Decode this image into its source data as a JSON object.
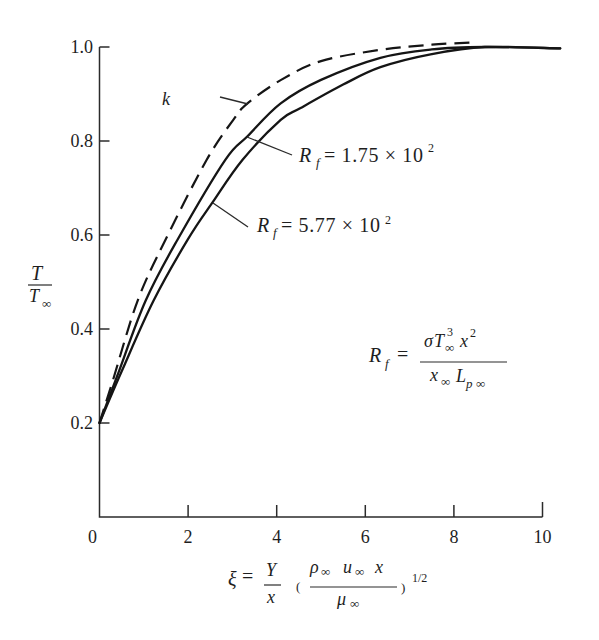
{
  "figure": {
    "y_axis_label": {
      "numerator": "T",
      "denominator": "T",
      "denominator_sub": "∞"
    },
    "x_axis_label": {
      "xi": "ξ",
      "eq": "=",
      "frac1_num": "Y",
      "frac1_den": "x",
      "open_paren": "(",
      "rho": "ρ",
      "rho_sub": "∞",
      "u": "u",
      "u_sub": "∞",
      "x": "x",
      "mu": "μ",
      "mu_sub": "∞",
      "close_paren": ")",
      "exponent": "1/2"
    },
    "annotations": {
      "k": {
        "label": "k"
      },
      "rf1": {
        "R": "R",
        "sub": "f",
        "rest": "= 1.75 × 10",
        "sup": "2"
      },
      "rf2": {
        "R": "R",
        "sub": "f",
        "rest": "= 5.77 × 10",
        "sup": "2"
      },
      "formula": {
        "R": "R",
        "sub": "f",
        "eq": "=",
        "num_sigma": "σ",
        "num_T": "T",
        "num_T_sup": "3",
        "num_T_sub": "∞",
        "num_x": "x",
        "num_x_sup": "2",
        "den_x": "x",
        "den_x_sub": "∞",
        "den_L": "L",
        "den_L_sub_p": "p",
        "den_L_sub_inf": "∞"
      }
    }
  },
  "chart_data": {
    "type": "line",
    "title": "",
    "xlabel": "ξ = (Y/x) (ρ∞ u∞ x / μ∞)^(1/2)",
    "ylabel": "T/T∞",
    "xlim": [
      0,
      10
    ],
    "ylim": [
      0,
      1.0
    ],
    "xticks": [
      0,
      2,
      4,
      6,
      8,
      10
    ],
    "xtick_labels": [
      "0",
      "2",
      "4",
      "6",
      "8",
      "10"
    ],
    "yticks": [
      0.2,
      0.4,
      0.6,
      0.8,
      1.0
    ],
    "ytick_labels": [
      "0.2",
      "0.4",
      "0.6",
      "0.8",
      "1.0"
    ],
    "grid": false,
    "legend": "none (curves labelled by annotations with leader lines)",
    "series": [
      {
        "id": "k",
        "name": "k",
        "style": "dashed",
        "x": [
          0,
          0.3,
          0.86,
          1.49,
          2.42,
          3.02,
          3.34,
          4.1,
          5.0,
          6.34,
          7.5,
          8.5
        ],
        "y": [
          0.2,
          0.29,
          0.46,
          0.59,
          0.76,
          0.845,
          0.88,
          0.93,
          0.97,
          0.994,
          1.005,
          1.01
        ]
      },
      {
        "id": "rf-175",
        "name": "Rf = 1.75 × 10^2",
        "style": "solid",
        "x": [
          0,
          0.4,
          1.04,
          1.76,
          2.84,
          3.34,
          4.09,
          5.0,
          6.34,
          7.5,
          8.7,
          10.4
        ],
        "y": [
          0.2,
          0.3,
          0.46,
          0.59,
          0.76,
          0.81,
          0.88,
          0.93,
          0.977,
          0.995,
          1.0,
          0.997
        ]
      },
      {
        "id": "rf-577",
        "name": "Rf = 5.77 × 10^2",
        "style": "solid",
        "x": [
          0,
          0.5,
          1.22,
          1.99,
          2.57,
          3.23,
          4.09,
          4.54,
          5.5,
          6.34,
          7.5,
          8.7,
          10.4
        ],
        "y": [
          0.2,
          0.31,
          0.46,
          0.59,
          0.672,
          0.76,
          0.845,
          0.87,
          0.92,
          0.957,
          0.985,
          1.0,
          0.997
        ]
      }
    ],
    "annotations": [
      {
        "text": "k",
        "points_to": "dashed curve",
        "at": [
          3.34,
          0.88
        ]
      },
      {
        "text": "Rf = 1.75 × 10^2",
        "points_to": "upper solid curve",
        "at": [
          3.34,
          0.81
        ]
      },
      {
        "text": "Rf = 5.77 × 10^2",
        "points_to": "lower solid curve",
        "at": [
          2.57,
          0.668
        ]
      },
      {
        "text": "Rf = σ T∞^3 x^2 / (x∞ L_p∞)",
        "type": "definition"
      }
    ]
  }
}
